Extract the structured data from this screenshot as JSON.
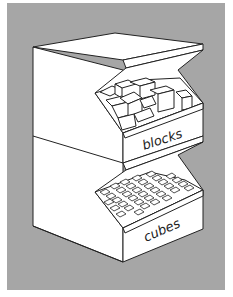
{
  "illustration": {
    "subject": "two stacked storage bins",
    "background_color": "#a6a6a6",
    "line_color": "#222222",
    "fill_color": "#ffffff",
    "bins": [
      {
        "label": "blocks",
        "contents": "large wooden blocks"
      },
      {
        "label": "cubes",
        "contents": "small cubes"
      }
    ]
  }
}
